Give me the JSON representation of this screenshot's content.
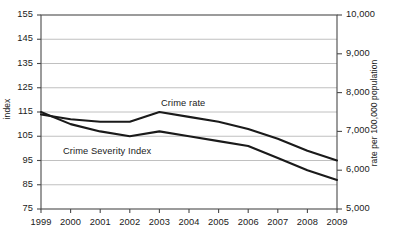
{
  "axes": {
    "left": {
      "title": "index",
      "ticks": [
        155,
        145,
        135,
        125,
        115,
        105,
        95,
        85,
        75
      ],
      "tick_labels": [
        "155",
        "145",
        "135",
        "125",
        "115",
        "105",
        "95",
        "85",
        "75"
      ],
      "min": 75,
      "max": 155
    },
    "right": {
      "title": "rate per 100,000 population",
      "ticks": [
        10000,
        9000,
        8000,
        7000,
        6000,
        5000
      ],
      "tick_labels": [
        "10,000",
        "9,000",
        "8,000",
        "7,000",
        "6,000",
        "5,000"
      ],
      "min": 5000,
      "max": 10000
    },
    "x": {
      "tick_labels": [
        "1999",
        "2000",
        "2001",
        "2002",
        "2003",
        "2004",
        "2005",
        "2006",
        "2007",
        "2008",
        "2009"
      ]
    }
  },
  "series_labels": {
    "crime_rate": "Crime rate",
    "crime_severity_index": "Crime Severity Index"
  },
  "colors": {
    "line": "#1a1a1a",
    "grid": "#b9b9b9",
    "axis": "#555555",
    "background": "#ffffff"
  },
  "chart_data": {
    "type": "line",
    "title": "",
    "xlabel": "",
    "ylabel": "index",
    "y2label": "rate per 100,000 population",
    "categories": [
      "1999",
      "2000",
      "2001",
      "2002",
      "2003",
      "2004",
      "2005",
      "2006",
      "2007",
      "2008",
      "2009"
    ],
    "x": [
      1999,
      2000,
      2001,
      2002,
      2003,
      2004,
      2005,
      2006,
      2007,
      2008,
      2009
    ],
    "ylim": [
      75,
      155
    ],
    "y2lim": [
      5000,
      10000
    ],
    "grid": true,
    "legend": "inline-annotations",
    "series": [
      {
        "name": "Crime rate",
        "axis": "right",
        "values": [
          114,
          112,
          111,
          111,
          115,
          113,
          111,
          108,
          104,
          99,
          95
        ],
        "values_rate_per_100000": [
          7440,
          7310,
          7250,
          7250,
          7490,
          7360,
          7230,
          7050,
          6790,
          6480,
          6250
        ]
      },
      {
        "name": "Crime Severity Index",
        "axis": "left",
        "values": [
          115,
          110,
          107,
          105,
          107,
          105,
          103,
          101,
          96,
          91,
          87
        ]
      }
    ]
  }
}
